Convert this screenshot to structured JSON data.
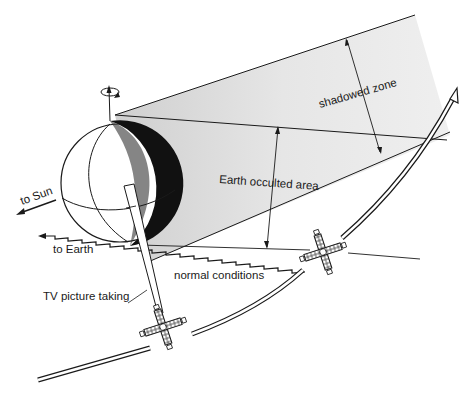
{
  "diagram": {
    "labels": {
      "shadowed_zone": "shadowed zone",
      "earth_occulted_area": "Earth occulted area",
      "to_sun": "to Sun",
      "to_earth": "to Earth",
      "normal_conditions": "normal conditions",
      "tv_picture_taking": "TV picture taking"
    },
    "colors": {
      "ink": "#1a1a1a",
      "shadow_fill": "#e6e6e6",
      "background": "#ffffff"
    }
  }
}
